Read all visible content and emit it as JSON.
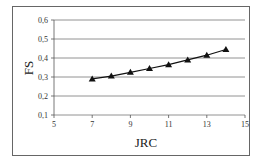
{
  "chart_data": {
    "type": "line",
    "title": "",
    "xlabel": "JRC",
    "ylabel": "FS",
    "xlim": [
      5,
      15
    ],
    "ylim": [
      0.1,
      0.6
    ],
    "x_ticks": [
      "5",
      "7",
      "9",
      "11",
      "13",
      "15"
    ],
    "y_ticks": [
      "0,1",
      "0,2",
      "0,3",
      "0,4",
      "0,5",
      "0,6"
    ],
    "grid": "horizontal",
    "legend": "none",
    "marker": "triangle",
    "x": [
      7,
      8,
      9,
      10,
      11,
      12,
      13,
      14
    ],
    "series": [
      {
        "name": "FS",
        "values": [
          0.29,
          0.305,
          0.325,
          0.345,
          0.365,
          0.39,
          0.415,
          0.445
        ]
      }
    ]
  }
}
